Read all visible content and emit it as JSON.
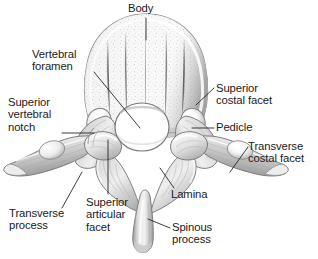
{
  "figure": {
    "type": "anatomical-illustration",
    "style": "grayscale pencil/airbrush medical illustration with stippled cancellous bone texture",
    "background_color": "#ffffff",
    "ink_color": "#1b1b1b",
    "bone_light": "#f4f4f4",
    "bone_mid": "#cfcfcf",
    "bone_shadow": "#8e8e8e",
    "outline_color": "#6e6e6e",
    "foramen_fill": "#ffffff",
    "width": 318,
    "height": 259
  },
  "labels": [
    {
      "id": "body",
      "text": "Body",
      "lines": [
        "Body"
      ],
      "x": 128,
      "y": 2,
      "align": "left",
      "leader": [
        [
          146,
          18
        ],
        [
          146,
          40
        ]
      ]
    },
    {
      "id": "vertebral-foramen",
      "text": "Vertebral foramen",
      "lines": [
        "Vertebral",
        "foramen"
      ],
      "x": 32,
      "y": 48,
      "align": "left",
      "leader": [
        [
          94,
          72
        ],
        [
          140,
          128
        ]
      ]
    },
    {
      "id": "superior-vertebral-notch",
      "text": "Superior vertebral notch",
      "lines": [
        "Superior",
        "vertebral",
        "notch"
      ],
      "x": 8,
      "y": 96,
      "align": "left",
      "leader": [
        [
          62,
          133
        ],
        [
          94,
          133
        ]
      ]
    },
    {
      "id": "superior-costal-facet",
      "text": "Superior costal facet",
      "lines": [
        "Superior",
        "costal facet"
      ],
      "x": 216,
      "y": 82,
      "align": "left",
      "leader": [
        [
          214,
          88
        ],
        [
          196,
          105
        ]
      ]
    },
    {
      "id": "pedicle",
      "text": "Pedicle",
      "lines": [
        "Pedicle"
      ],
      "x": 216,
      "y": 121,
      "align": "left",
      "leader": [
        [
          214,
          128
        ],
        [
          192,
          128
        ]
      ]
    },
    {
      "id": "transverse-costal-facet",
      "text": "Transverse costal facet",
      "lines": [
        "Transverse",
        "costal facet"
      ],
      "x": 248,
      "y": 140,
      "align": "left",
      "leader": [
        [
          248,
          147
        ],
        [
          230,
          172
        ]
      ]
    },
    {
      "id": "transverse-process",
      "text": "Transverse process",
      "lines": [
        "Transverse",
        "process"
      ],
      "x": 9,
      "y": 207,
      "align": "left",
      "leader": [
        [
          62,
          208
        ],
        [
          82,
          172
        ]
      ]
    },
    {
      "id": "superior-articular-facet",
      "text": "Superior articular facet",
      "lines": [
        "Superior",
        "articular",
        "facet"
      ],
      "x": 86,
      "y": 196,
      "align": "left",
      "leader": [
        [
          108,
          194
        ],
        [
          108,
          140
        ]
      ]
    },
    {
      "id": "lamina",
      "text": "Lamina",
      "lines": [
        "Lamina"
      ],
      "x": 171,
      "y": 188,
      "align": "left",
      "leader": [
        [
          174,
          188
        ],
        [
          160,
          168
        ]
      ]
    },
    {
      "id": "spinous-process",
      "text": "Spinous process",
      "lines": [
        "Spinous",
        "process"
      ],
      "x": 172,
      "y": 221,
      "align": "left",
      "leader": [
        [
          170,
          228
        ],
        [
          148,
          219
        ]
      ]
    }
  ]
}
